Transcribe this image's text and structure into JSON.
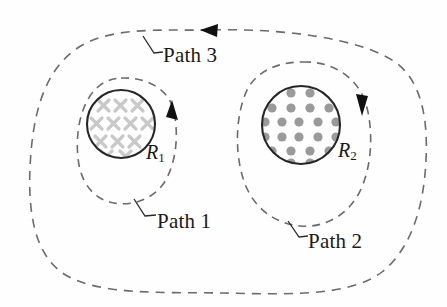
{
  "figure": {
    "background_color": "#fefefe"
  },
  "labels": {
    "path1": "Path 1",
    "path2": "Path 2",
    "path3": "Path 3",
    "radius1_text": "R",
    "radius1_sub": "1",
    "radius2_text": "R",
    "radius2_sub": "2"
  },
  "colors": {
    "dash_stroke": "#6b6b6b",
    "circle_stroke": "#262626",
    "cross_fill": "#c9c9c9",
    "dot_fill": "#9a9a9a",
    "text": "#1a1a1a",
    "arrow_fill": "#111111"
  },
  "regions": [
    {
      "name": "region-1",
      "label": "R1",
      "field_symbol": "cross",
      "field_meaning": "into-page",
      "center_x": 121,
      "center_y": 124,
      "radius": 35,
      "marker_count": 12,
      "marker_color": "#c9c9c9"
    },
    {
      "name": "region-2",
      "label": "R2",
      "field_symbol": "dot",
      "field_meaning": "out-of-page",
      "center_x": 301,
      "center_y": 125,
      "radius": 40,
      "marker_count": 26,
      "marker_color": "#9a9a9a"
    }
  ],
  "paths": [
    {
      "name": "path-1",
      "label": "Path 1",
      "style": "dashed",
      "encloses": [
        "region-1"
      ],
      "direction": "counterclockwise",
      "arrow_position": {
        "x": 172,
        "y": 112
      },
      "arrow_direction": "up",
      "leader_from": {
        "x": 134,
        "y": 199
      },
      "leader_to": {
        "x": 152,
        "y": 216
      }
    },
    {
      "name": "path-2",
      "label": "Path 2",
      "style": "dashed",
      "encloses": [
        "region-2"
      ],
      "direction": "clockwise",
      "arrow_position": {
        "x": 362,
        "y": 106
      },
      "arrow_direction": "down",
      "leader_from": {
        "x": 288,
        "y": 221
      },
      "leader_to": {
        "x": 304,
        "y": 237
      }
    },
    {
      "name": "path-3",
      "label": "Path 3",
      "style": "dashed",
      "encloses": [
        "region-1",
        "region-2"
      ],
      "direction": "clockwise",
      "arrow_position": {
        "x": 212,
        "y": 30
      },
      "arrow_direction": "left",
      "leader_from": {
        "x": 143,
        "y": 36
      },
      "leader_to": {
        "x": 160,
        "y": 52
      }
    }
  ],
  "cross_markers": [
    {
      "x": 104,
      "y": 106
    },
    {
      "x": 121,
      "y": 106
    },
    {
      "x": 138,
      "y": 106
    },
    {
      "x": 104,
      "y": 124
    },
    {
      "x": 121,
      "y": 124
    },
    {
      "x": 138,
      "y": 124
    },
    {
      "x": 104,
      "y": 142
    },
    {
      "x": 121,
      "y": 142
    },
    {
      "x": 138,
      "y": 142
    },
    {
      "x": 95,
      "y": 115
    },
    {
      "x": 95,
      "y": 133
    },
    {
      "x": 147,
      "y": 124
    }
  ],
  "dot_markers": [
    {
      "x": 290,
      "y": 93
    },
    {
      "x": 307,
      "y": 93
    },
    {
      "x": 273,
      "y": 107
    },
    {
      "x": 290,
      "y": 107
    },
    {
      "x": 307,
      "y": 107
    },
    {
      "x": 324,
      "y": 107
    },
    {
      "x": 266,
      "y": 121
    },
    {
      "x": 282,
      "y": 121
    },
    {
      "x": 299,
      "y": 121
    },
    {
      "x": 316,
      "y": 121
    },
    {
      "x": 333,
      "y": 121
    },
    {
      "x": 266,
      "y": 136
    },
    {
      "x": 282,
      "y": 136
    },
    {
      "x": 299,
      "y": 136
    },
    {
      "x": 316,
      "y": 136
    },
    {
      "x": 333,
      "y": 136
    },
    {
      "x": 273,
      "y": 150
    },
    {
      "x": 290,
      "y": 150
    },
    {
      "x": 307,
      "y": 150
    },
    {
      "x": 324,
      "y": 150
    },
    {
      "x": 290,
      "y": 162
    },
    {
      "x": 307,
      "y": 162
    }
  ]
}
